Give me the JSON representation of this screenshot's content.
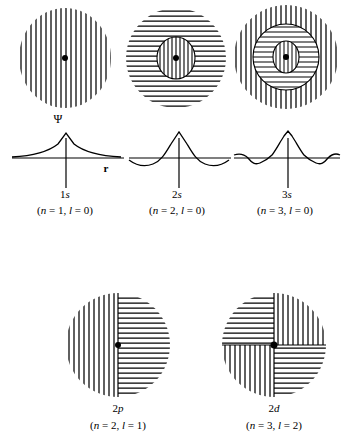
{
  "figure": {
    "type": "diagram",
    "axis_labels": {
      "psi": "Ψ",
      "r": "r"
    }
  },
  "orbitals": [
    {
      "id": "1s",
      "name": "1s",
      "name_num": "1",
      "name_letter": "s",
      "quantum": "(n = 1, l = 0)",
      "n": 1,
      "l": 0,
      "shape": "circle",
      "regions": [
        {
          "hatch": "vertical",
          "shape": "circle",
          "rx": 46,
          "ry": 50
        }
      ],
      "nodes": 0,
      "center_dot": true
    },
    {
      "id": "2s",
      "name": "2s",
      "name_num": "2",
      "name_letter": "s",
      "quantum": "(n = 2, l = 0)",
      "n": 2,
      "l": 0,
      "shape": "circle",
      "regions": [
        {
          "hatch": "horizontal",
          "shape": "circle",
          "rx": 50,
          "ry": 50
        },
        {
          "hatch": "vertical",
          "shape": "circle",
          "rx": 19,
          "ry": 21,
          "outlined": true
        }
      ],
      "nodes": 1,
      "center_dot": true
    },
    {
      "id": "3s",
      "name": "3s",
      "name_num": "3",
      "name_letter": "s",
      "quantum": "(n = 3, l = 0)",
      "n": 3,
      "l": 0,
      "shape": "circle",
      "regions": [
        {
          "hatch": "vertical",
          "shape": "circle",
          "rx": 52,
          "ry": 52
        },
        {
          "hatch": "horizontal",
          "shape": "circle",
          "rx": 33,
          "ry": 33,
          "outlined": true
        },
        {
          "hatch": "vertical",
          "shape": "circle",
          "rx": 13,
          "ry": 16,
          "outlined": true
        }
      ],
      "nodes": 2,
      "center_dot": true
    },
    {
      "id": "2p",
      "name": "2p",
      "name_num": "2",
      "name_letter": "p",
      "quantum": "(n = 2, l = 1)",
      "n": 2,
      "l": 1,
      "shape": "circle-split-vertical",
      "regions": [
        {
          "hatch": "vertical",
          "half": "left"
        },
        {
          "hatch": "horizontal",
          "half": "right"
        }
      ],
      "nodes": 1,
      "center_dot": true
    },
    {
      "id": "2d",
      "name": "2d",
      "name_num": "2",
      "name_letter": "d",
      "quantum": "(n = 3, l = 2)",
      "n": 3,
      "l": 2,
      "shape": "circle-quadrants",
      "regions": [
        {
          "hatch": "horizontal",
          "quadrant": "top-left"
        },
        {
          "hatch": "vertical",
          "quadrant": "top-right"
        },
        {
          "hatch": "vertical",
          "quadrant": "bottom-left"
        },
        {
          "hatch": "horizontal",
          "quadrant": "bottom-right"
        }
      ],
      "nodes": 2,
      "center_dot": true
    }
  ],
  "plots": [
    {
      "for": "1s",
      "type": "line",
      "description": "Wavefunction Ψ vs r, single positive cusp, decays to zero, no nodes",
      "has_psi_label": true,
      "has_r_label": true,
      "lobes": 1,
      "node_count": 0
    },
    {
      "for": "2s",
      "type": "line",
      "description": "Wavefunction Ψ vs r, central positive cusp with one negative lobe on each side",
      "has_psi_label": false,
      "has_r_label": false,
      "lobes": 3,
      "node_count": 1
    },
    {
      "for": "3s",
      "type": "line",
      "description": "Wavefunction Ψ vs r, central positive cusp with two oscillations on each side",
      "has_psi_label": false,
      "has_r_label": false,
      "lobes": 5,
      "node_count": 2
    }
  ],
  "colors": {
    "ink": "#000000",
    "background": "#ffffff"
  }
}
